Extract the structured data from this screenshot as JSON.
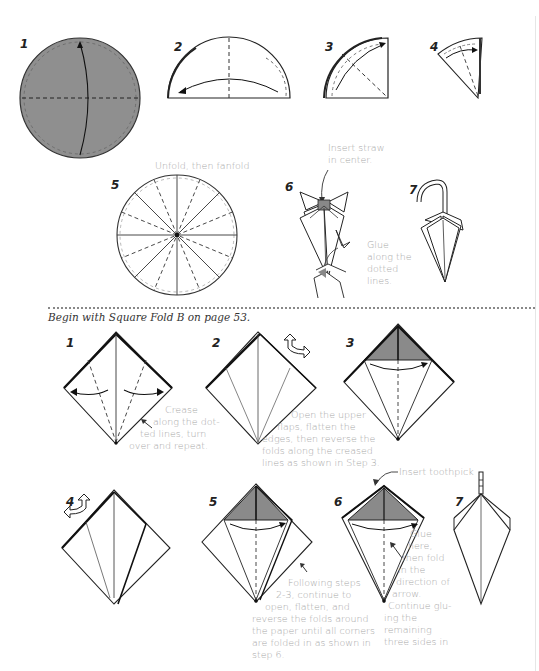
{
  "page": {
    "section_top": {
      "title": "Umbrella from circle (fanfold)",
      "steps": [
        {
          "number": "1",
          "caption": ""
        },
        {
          "number": "2",
          "caption": ""
        },
        {
          "number": "3",
          "caption": ""
        },
        {
          "number": "4",
          "caption": ""
        },
        {
          "number": "5",
          "caption": "Unfold, then fanfold"
        },
        {
          "number": "6",
          "caption_top": "Insert straw in center.",
          "caption_top_lines": [
            "Insert straw",
            "in center."
          ],
          "caption_side_lines": [
            "Glue",
            "along the",
            "dotted",
            "lines."
          ]
        },
        {
          "number": "7",
          "caption": ""
        }
      ]
    },
    "section_bottom": {
      "intro": "Begin with Square Fold B on page 53.",
      "steps": [
        {
          "number": "1",
          "caption_lines": [
            "Crease",
            "along the dot-",
            "ted lines, turn",
            "over and repeat."
          ]
        },
        {
          "number": "2",
          "caption_lines": [
            "Open the upper",
            "flaps, flatten the",
            "edges, then reverse the",
            "folds along the creased",
            "lines as shown in Step 3."
          ]
        },
        {
          "number": "3",
          "caption_lines": []
        },
        {
          "number": "4",
          "caption_lines": []
        },
        {
          "number": "5",
          "caption_lines": [
            "Following steps",
            "2-3, continue to",
            "open, flatten, and",
            "reverse the folds around",
            "the paper until all corners",
            "are folded in as shown in",
            "step 6."
          ]
        },
        {
          "number": "6",
          "caption_top": "Insert toothpick",
          "caption_lines": [
            "Glue",
            "here,",
            "then fold",
            "in the",
            "direction of",
            "arrow.",
            "Continue glu-",
            "ing the",
            "remaining",
            "three sides in"
          ]
        },
        {
          "number": "7",
          "caption_lines": []
        }
      ]
    },
    "colors": {
      "paper_gray": "#8f8f8f",
      "shade_gray": "#8a8a8a",
      "line": "#222222",
      "caption": "#a8a8a8"
    }
  }
}
